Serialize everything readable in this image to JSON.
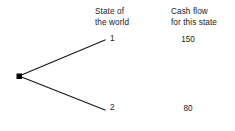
{
  "diagram": {
    "type": "event-tree",
    "background_color": "#ffffff",
    "stroke_color": "#1a1a1a",
    "columns": [
      {
        "id": "state-of-the-world",
        "header_line1": "State of",
        "header_line2": "the world"
      },
      {
        "id": "cash-flow",
        "header_line1": "Cash flow",
        "header_line2": "for this state"
      }
    ],
    "root_node": {
      "label": "decision-node",
      "x": 19,
      "y": 76,
      "shape": "filled-square",
      "size": 5
    },
    "branches": [
      {
        "id": "branch-1",
        "state_label": "1",
        "cash_flow": "150",
        "from_x": 19,
        "from_y": 76,
        "to_x": 105,
        "to_y": 40
      },
      {
        "id": "branch-2",
        "state_label": "2",
        "cash_flow": "80",
        "from_x": 19,
        "from_y": 76,
        "to_x": 105,
        "to_y": 110
      }
    ]
  }
}
